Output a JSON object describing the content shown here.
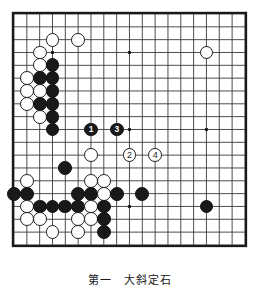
{
  "figure": {
    "caption": "第一　大斜定石",
    "caption_top": 271
  },
  "board": {
    "size": 19,
    "left": 14,
    "top": 14,
    "spacing": 12.83,
    "line_color": "#3a3a3a",
    "border_color": "#1a1a1a",
    "background_color": "#ffffff",
    "star_points": [
      {
        "col": 3,
        "row": 3
      },
      {
        "col": 9,
        "row": 3
      },
      {
        "col": 15,
        "row": 3
      },
      {
        "col": 3,
        "row": 9
      },
      {
        "col": 9,
        "row": 9
      },
      {
        "col": 15,
        "row": 9
      },
      {
        "col": 3,
        "row": 15
      },
      {
        "col": 9,
        "row": 15
      },
      {
        "col": 15,
        "row": 15
      }
    ]
  },
  "colors": {
    "black_stone": "#191919",
    "white_stone": "#ffffff",
    "white_stone_edge": "#1b1b1b",
    "black_label": "#ffffff",
    "white_label": "#1b1b1b"
  },
  "stones": [
    {
      "col": 3,
      "row": 2,
      "color": "white",
      "label": ""
    },
    {
      "col": 5,
      "row": 2,
      "color": "white",
      "label": ""
    },
    {
      "col": 15,
      "row": 3,
      "color": "white",
      "label": ""
    },
    {
      "col": 2,
      "row": 3,
      "color": "white",
      "label": ""
    },
    {
      "col": 2,
      "row": 4,
      "color": "white",
      "label": ""
    },
    {
      "col": 3,
      "row": 4,
      "color": "black",
      "label": ""
    },
    {
      "col": 1,
      "row": 5,
      "color": "white",
      "label": ""
    },
    {
      "col": 2,
      "row": 5,
      "color": "black",
      "label": ""
    },
    {
      "col": 3,
      "row": 5,
      "color": "black",
      "label": ""
    },
    {
      "col": 1,
      "row": 6,
      "color": "white",
      "label": ""
    },
    {
      "col": 2,
      "row": 6,
      "color": "white",
      "label": ""
    },
    {
      "col": 3,
      "row": 6,
      "color": "black",
      "label": ""
    },
    {
      "col": 1,
      "row": 7,
      "color": "white",
      "label": ""
    },
    {
      "col": 2,
      "row": 7,
      "color": "black",
      "label": ""
    },
    {
      "col": 3,
      "row": 7,
      "color": "black",
      "label": ""
    },
    {
      "col": 2,
      "row": 8,
      "color": "white",
      "label": ""
    },
    {
      "col": 3,
      "row": 8,
      "color": "black",
      "label": ""
    },
    {
      "col": 3,
      "row": 9,
      "color": "black",
      "label": ""
    },
    {
      "col": 6,
      "row": 9,
      "color": "black",
      "label": "1"
    },
    {
      "col": 8,
      "row": 9,
      "color": "black",
      "label": "3"
    },
    {
      "col": 6,
      "row": 11,
      "color": "white",
      "label": ""
    },
    {
      "col": 9,
      "row": 11,
      "color": "white",
      "label": "2"
    },
    {
      "col": 11,
      "row": 11,
      "color": "white",
      "label": "4"
    },
    {
      "col": 4,
      "row": 12,
      "color": "black",
      "label": ""
    },
    {
      "col": 6,
      "row": 13,
      "color": "white",
      "label": ""
    },
    {
      "col": 7,
      "row": 13,
      "color": "white",
      "label": ""
    },
    {
      "col": 1,
      "row": 13,
      "color": "white",
      "label": ""
    },
    {
      "col": 0,
      "row": 14,
      "color": "black",
      "label": ""
    },
    {
      "col": 1,
      "row": 14,
      "color": "black",
      "label": ""
    },
    {
      "col": 5,
      "row": 14,
      "color": "black",
      "label": ""
    },
    {
      "col": 6,
      "row": 14,
      "color": "black",
      "label": ""
    },
    {
      "col": 7,
      "row": 14,
      "color": "white",
      "label": ""
    },
    {
      "col": 8,
      "row": 14,
      "color": "black",
      "label": ""
    },
    {
      "col": 10,
      "row": 14,
      "color": "black",
      "label": ""
    },
    {
      "col": 1,
      "row": 15,
      "color": "white",
      "label": ""
    },
    {
      "col": 2,
      "row": 15,
      "color": "black",
      "label": ""
    },
    {
      "col": 3,
      "row": 15,
      "color": "black",
      "label": ""
    },
    {
      "col": 4,
      "row": 15,
      "color": "black",
      "label": ""
    },
    {
      "col": 5,
      "row": 15,
      "color": "black",
      "label": ""
    },
    {
      "col": 6,
      "row": 15,
      "color": "white",
      "label": ""
    },
    {
      "col": 7,
      "row": 15,
      "color": "black",
      "label": ""
    },
    {
      "col": 15,
      "row": 15,
      "color": "black",
      "label": ""
    },
    {
      "col": 1,
      "row": 16,
      "color": "white",
      "label": ""
    },
    {
      "col": 2,
      "row": 16,
      "color": "white",
      "label": ""
    },
    {
      "col": 5,
      "row": 16,
      "color": "white",
      "label": ""
    },
    {
      "col": 6,
      "row": 16,
      "color": "white",
      "label": ""
    },
    {
      "col": 7,
      "row": 16,
      "color": "black",
      "label": ""
    },
    {
      "col": 3,
      "row": 17,
      "color": "white",
      "label": ""
    },
    {
      "col": 5,
      "row": 17,
      "color": "white",
      "label": ""
    },
    {
      "col": 7,
      "row": 17,
      "color": "black",
      "label": ""
    }
  ]
}
